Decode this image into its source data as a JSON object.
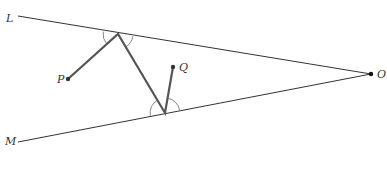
{
  "diagram": {
    "labels": {
      "L": "L",
      "M": "M",
      "O": "O",
      "P": "P",
      "Q": "Q"
    },
    "points": {
      "L": [
        18,
        16
      ],
      "M": [
        18,
        142
      ],
      "O": [
        371,
        74
      ],
      "P": [
        68,
        79
      ],
      "Q": [
        173,
        67
      ],
      "reflect_L": [
        118,
        34
      ],
      "reflect_M": [
        165,
        113
      ]
    },
    "colors": {
      "line": "#333333",
      "path": "#555555",
      "arc": "#666666"
    }
  }
}
